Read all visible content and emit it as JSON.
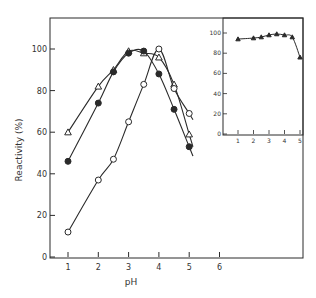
{
  "chart_data": [
    {
      "type": "line",
      "title": "",
      "xlabel": "pH",
      "ylabel": "Reactivity (%)",
      "xlim": [
        0.4,
        8.7
      ],
      "ylim": [
        0,
        115
      ],
      "x_ticks": [
        "1",
        "2",
        "3",
        "4",
        "5",
        "6"
      ],
      "y_ticks": [
        "0",
        "20",
        "40",
        "60",
        "80",
        "100"
      ],
      "grid": false,
      "legend": "none (markers only)",
      "series": [
        {
          "name": "open-triangle",
          "marker": "open-triangle",
          "x": [
            1.0,
            2.0,
            2.5,
            3.0,
            3.5,
            4.0,
            4.5,
            5.0
          ],
          "y": [
            60,
            82,
            90,
            99,
            98,
            96,
            83,
            59
          ]
        },
        {
          "name": "filled-circle",
          "marker": "filled-circle",
          "x": [
            1.0,
            2.0,
            2.5,
            3.0,
            3.5,
            4.0,
            4.5,
            5.0
          ],
          "y": [
            46,
            74,
            89,
            98,
            99,
            88,
            71,
            53
          ]
        },
        {
          "name": "open-circle",
          "marker": "open-circle",
          "x": [
            1.0,
            2.0,
            2.5,
            3.0,
            3.5,
            4.0,
            4.5,
            5.0
          ],
          "y": [
            12,
            37,
            47,
            65,
            83,
            100,
            81,
            69
          ]
        }
      ]
    },
    {
      "type": "line",
      "title": "",
      "xlabel": "",
      "ylabel": "",
      "inset": true,
      "xlim": [
        0.5,
        5.7
      ],
      "ylim": [
        0,
        110
      ],
      "x_ticks": [
        "1",
        "2",
        "3",
        "4",
        "5"
      ],
      "y_ticks": [
        "0",
        "20",
        "40",
        "60",
        "80",
        "100"
      ],
      "grid": false,
      "series": [
        {
          "name": "filled-triangle",
          "marker": "filled-triangle",
          "x": [
            1.0,
            2.0,
            2.5,
            3.0,
            3.5,
            4.0,
            4.5,
            5.0
          ],
          "y": [
            94,
            95,
            96,
            98,
            99,
            98,
            96,
            76
          ]
        }
      ]
    }
  ],
  "labels": {
    "xlabel": "pH",
    "ylabel": "Reactivity (%)",
    "main_x_ticks": [
      "1",
      "2",
      "3",
      "4",
      "5",
      "6"
    ],
    "main_y_ticks": [
      "0",
      "20",
      "40",
      "60",
      "80",
      "100"
    ],
    "inset_x_ticks": [
      "1",
      "2",
      "3",
      "4",
      "5"
    ],
    "inset_y_ticks": [
      "0",
      "20",
      "40",
      "60",
      "80",
      "100"
    ]
  },
  "colors": {
    "ink": "#2a2a2a",
    "background": "#ffffff"
  }
}
